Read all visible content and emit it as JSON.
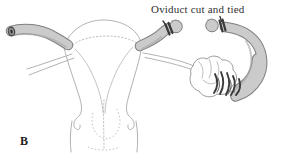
{
  "figure": {
    "panel_label": "B",
    "annotation": "Oviduct cut and tied"
  },
  "diagram": {
    "type": "anatomical line illustration",
    "parts": [
      "uterus",
      "cervix",
      "vaginal-walls",
      "left-oviduct",
      "left-oviduct-cut-end",
      "right-oviduct-proximal-stump",
      "proximal-ligature-tie",
      "right-oviduct-distal-stump",
      "distal-ligature-tie",
      "ovary",
      "fimbriae",
      "ovarian-ligament",
      "left-ligament"
    ],
    "colors": {
      "background": "#ffffff",
      "tube_fill": "#cbcbcb",
      "tube_outline": "#7f7f7f",
      "uterus_outline": "#b2b2b2",
      "ligature_tie": "#3a3a3a",
      "text": "#2f2f2f"
    }
  }
}
